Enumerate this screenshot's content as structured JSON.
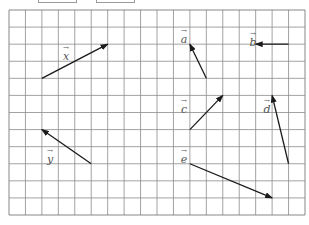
{
  "figure": {
    "grid": {
      "columns": 18,
      "rows": 12,
      "left": 9,
      "top": 10,
      "right": 305,
      "bottom": 215,
      "line_color": "#8c8c8c",
      "border_color": "#6b6b6b"
    },
    "arrow_color": "#1a1a1a",
    "label_color": "#555555",
    "top_boxes": [
      {
        "left": 38,
        "width": 37
      },
      {
        "left": 96,
        "width": 37
      }
    ],
    "vectors": [
      {
        "name": "x",
        "label": "x",
        "from": [
          2,
          4
        ],
        "to": [
          6,
          2
        ],
        "label_pos": [
          60,
          45
        ]
      },
      {
        "name": "y",
        "label": "y",
        "from": [
          5,
          9
        ],
        "to": [
          2,
          7
        ],
        "label_pos": [
          44,
          148
        ]
      },
      {
        "name": "a",
        "label": "a",
        "from": [
          12,
          4
        ],
        "to": [
          11,
          2
        ],
        "label_pos": [
          178,
          28
        ]
      },
      {
        "name": "b",
        "label": "b",
        "from": [
          17,
          2
        ],
        "to": [
          15,
          2
        ],
        "label_pos": [
          247,
          31
        ]
      },
      {
        "name": "c",
        "label": "c",
        "from": [
          11,
          7
        ],
        "to": [
          13,
          5
        ],
        "label_pos": [
          178,
          98
        ]
      },
      {
        "name": "d",
        "label": "d",
        "from": [
          17,
          9
        ],
        "to": [
          16,
          5
        ],
        "label_pos": [
          261,
          98
        ]
      },
      {
        "name": "e",
        "label": "e",
        "from": [
          11,
          9
        ],
        "to": [
          16,
          11
        ],
        "label_pos": [
          178,
          148
        ]
      }
    ],
    "arrow_glyph": "→"
  }
}
